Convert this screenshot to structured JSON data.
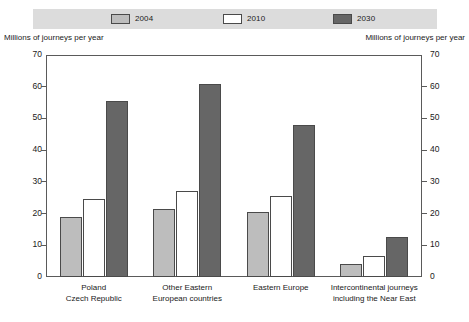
{
  "chart_data": {
    "type": "bar",
    "title": "",
    "subtitle": "",
    "xlabel": "",
    "ylabel": "Millions of journeys per year",
    "ylabel_right": "Millions of journeys per year",
    "ylim": [
      0,
      70
    ],
    "yticks": [
      0,
      10,
      20,
      30,
      40,
      50,
      60,
      70
    ],
    "ytick_labels": [
      "0",
      "10",
      "20",
      "30",
      "40",
      "50",
      "60",
      "70"
    ],
    "grid": false,
    "legend_position": "top",
    "categories": [
      "Poland\nCzech Republic",
      "Other Eastern\nEuropean countries",
      "Eastern Europe",
      "Intercontinental journeys\nincluding the Near East"
    ],
    "category_lines": [
      [
        "Poland",
        "Czech Republic"
      ],
      [
        "Other Eastern",
        "European countries"
      ],
      [
        "Eastern Europe",
        ""
      ],
      [
        "Intercontinental journeys",
        "including the Near East"
      ]
    ],
    "series": [
      {
        "name": "2004",
        "color": "#bdbdbd",
        "values": [
          19,
          21.5,
          20.5,
          4
        ]
      },
      {
        "name": "2010",
        "color": "#ffffff",
        "values": [
          24.5,
          27,
          25.5,
          6.5
        ]
      },
      {
        "name": "2030",
        "color": "#666666",
        "values": [
          55.5,
          61,
          48,
          12.5
        ]
      }
    ]
  },
  "legend": {
    "items": [
      {
        "label": "2004",
        "color": "#bdbdbd"
      },
      {
        "label": "2010",
        "color": "#ffffff"
      },
      {
        "label": "2030",
        "color": "#666666"
      }
    ]
  },
  "axes": {
    "left_caption": "Millions of journeys per year",
    "right_caption": "Millions of journeys per year"
  },
  "colors": {
    "legend_band": "#dcdcdc",
    "series_2004": "#bdbdbd",
    "series_2010": "#ffffff",
    "series_2030": "#666666",
    "frame": "#5a5a5a",
    "text": "#1a1a1a"
  }
}
